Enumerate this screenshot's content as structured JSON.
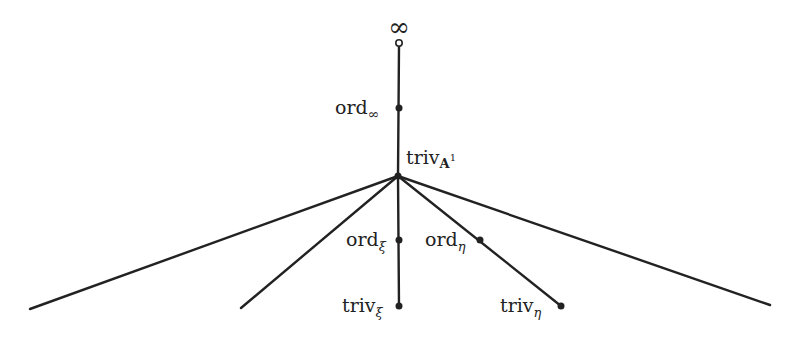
{
  "diagram": {
    "type": "tree",
    "color": "#222222",
    "nodes": {
      "infinity": {
        "label": "∞",
        "x": 399,
        "y": 43,
        "style": "open"
      },
      "ord_inf": {
        "label": "ord",
        "sub": "∞",
        "x": 399,
        "y": 108
      },
      "triv_A1": {
        "label": "triv",
        "sub": "A",
        "sup": "1",
        "x": 398,
        "y": 176
      },
      "ord_xi": {
        "label": "ord",
        "sub": "ξ",
        "x": 399,
        "y": 240
      },
      "ord_eta": {
        "label": "ord",
        "sub": "η",
        "x": 480,
        "y": 240
      },
      "triv_xi": {
        "label": "triv",
        "sub": "ξ",
        "x": 399,
        "y": 306
      },
      "triv_eta": {
        "label": "triv",
        "sub": "η",
        "x": 561,
        "y": 306
      }
    },
    "edges": [
      [
        "infinity",
        "triv_A1"
      ],
      [
        "triv_A1",
        "triv_xi"
      ],
      [
        "triv_A1",
        "triv_eta"
      ],
      [
        "triv_A1",
        "left_far"
      ],
      [
        "triv_A1",
        "left_near"
      ],
      [
        "triv_A1",
        "right_far"
      ]
    ],
    "open_ends": {
      "left_far": {
        "x": 30,
        "y": 309
      },
      "left_near": {
        "x": 241,
        "y": 308
      },
      "right_far": {
        "x": 770,
        "y": 305
      }
    }
  },
  "labels": {
    "infinity": "∞",
    "ord": "ord",
    "triv": "triv",
    "sub_inf": "∞",
    "sub_A": "A",
    "sup_1": "1",
    "sub_xi": "ξ",
    "sub_eta": "η"
  }
}
